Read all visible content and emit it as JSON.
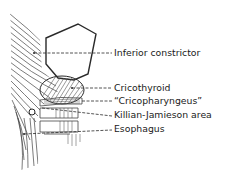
{
  "figure": {
    "type": "anatomical-illustration",
    "labels": [
      {
        "id": "inferior-constrictor",
        "text": "Inferior constrictor",
        "y": 52
      },
      {
        "id": "cricothyroid",
        "text": "Cricothyroid",
        "y": 89
      },
      {
        "id": "cricopharyngeus",
        "text": "“Cricopharyngeus”",
        "y": 101
      },
      {
        "id": "killian-jamieson-area",
        "text": "Killian-Jamieson area",
        "y": 115
      },
      {
        "id": "esophagus",
        "text": "Esophagus",
        "y": 129
      }
    ],
    "colors": {
      "line": "#2a2a2a",
      "background": "#ffffff"
    }
  }
}
